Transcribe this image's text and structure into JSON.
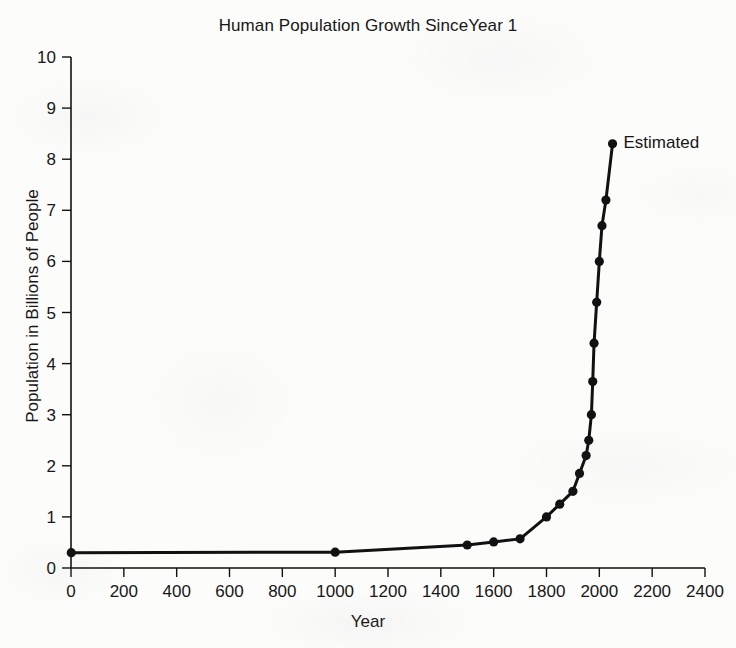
{
  "chart_data": {
    "type": "line",
    "title": "Human Population Growth SinceYear 1",
    "xlabel": "Year",
    "ylabel": "Population in Billions of People",
    "xlim": [
      0,
      2400
    ],
    "ylim": [
      0,
      10
    ],
    "xticks": [
      0,
      200,
      400,
      600,
      800,
      1000,
      1200,
      1400,
      1600,
      1800,
      2000,
      2200,
      2400
    ],
    "yticks": [
      0,
      1,
      2,
      3,
      4,
      5,
      6,
      7,
      8,
      9,
      10
    ],
    "xtick_labels": [
      "0",
      "200",
      "400",
      "600",
      "800",
      "1000",
      "1200",
      "1400",
      "1600",
      "1800",
      "2000",
      "2200",
      "2400"
    ],
    "ytick_labels": [
      "0",
      "1",
      "2",
      "3",
      "4",
      "5",
      "6",
      "7",
      "8",
      "9",
      "10"
    ],
    "grid": false,
    "legend_position": "none",
    "marker": "filled-circle",
    "line_color": "#111111",
    "marker_color": "#111111",
    "annotations": [
      {
        "text": "Estimated",
        "x": 2050,
        "y": 8.3
      }
    ],
    "series": [
      {
        "name": "World population",
        "x": [
          1,
          1000,
          1500,
          1600,
          1700,
          1800,
          1850,
          1900,
          1925,
          1950,
          1960,
          1970,
          1975,
          1980,
          1990,
          2000,
          2010,
          2025,
          2050
        ],
        "values": [
          0.3,
          0.31,
          0.45,
          0.51,
          0.57,
          1.0,
          1.25,
          1.5,
          1.85,
          2.2,
          2.5,
          3.0,
          3.65,
          4.4,
          5.2,
          6.0,
          6.7,
          7.2,
          8.3
        ]
      }
    ]
  },
  "annotation_label": "Estimated"
}
